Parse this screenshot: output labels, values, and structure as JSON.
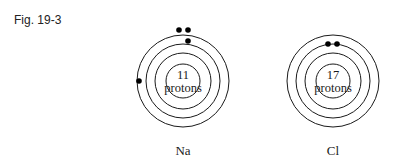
{
  "figure": {
    "label": "Fig. 19-3"
  },
  "atoms": [
    {
      "symbol": "Na",
      "nucleus_line1": "11",
      "nucleus_line2": "protons",
      "center": [
        183,
        81
      ],
      "shell_radii": [
        17,
        28,
        37,
        46
      ],
      "electrons": [
        [
          179,
          30
        ],
        [
          188,
          30
        ],
        [
          188,
          41
        ],
        [
          139,
          81
        ]
      ]
    },
    {
      "symbol": "Cl",
      "nucleus_line1": "17",
      "nucleus_line2": "protons",
      "center": [
        333,
        81
      ],
      "shell_radii": [
        17,
        28,
        37,
        46
      ],
      "electrons": [
        [
          328,
          43
        ],
        [
          337,
          43
        ]
      ]
    }
  ]
}
